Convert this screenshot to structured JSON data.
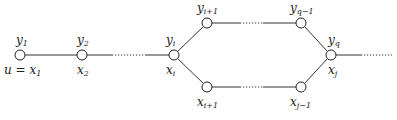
{
  "diagram": {
    "type": "path-graph-with-cycle",
    "nodes": [
      {
        "id": "x1",
        "x": 20,
        "y": 55,
        "top_label": "y",
        "top_sub": "1",
        "bottom_label": "u = x",
        "bottom_sub": "1"
      },
      {
        "id": "x2",
        "x": 82,
        "y": 55,
        "top_label": "y",
        "top_sub": "2",
        "bottom_label": "x",
        "bottom_sub": "2"
      },
      {
        "id": "xi",
        "x": 174,
        "y": 55,
        "top_label": "y",
        "top_sub": "i",
        "bottom_label": "x",
        "bottom_sub": "i"
      },
      {
        "id": "top_left",
        "x": 207,
        "y": 23,
        "top_label": "y",
        "top_sub": "i+1"
      },
      {
        "id": "top_right",
        "x": 301,
        "y": 23,
        "top_label": "y",
        "top_sub": "q−1"
      },
      {
        "id": "bottom_left",
        "x": 207,
        "y": 87,
        "bottom_label": "x",
        "bottom_sub": "i+1"
      },
      {
        "id": "bottom_right",
        "x": 301,
        "y": 87,
        "bottom_label": "x",
        "bottom_sub": "j−1"
      },
      {
        "id": "xj",
        "x": 331,
        "y": 55,
        "top_label": "y",
        "top_sub": "q",
        "bottom_label": "x",
        "bottom_sub": "j"
      }
    ],
    "edges": [
      {
        "from": "x1",
        "to": "x2",
        "style": "solid"
      },
      {
        "from": "x2",
        "to": "xi",
        "style": "solid-dotted-solid"
      },
      {
        "from": "xi",
        "to": "top_left",
        "style": "solid"
      },
      {
        "from": "xi",
        "to": "bottom_left",
        "style": "solid"
      },
      {
        "from": "top_left",
        "to": "top_right",
        "style": "solid-dotted-solid"
      },
      {
        "from": "bottom_left",
        "to": "bottom_right",
        "style": "solid-dotted-solid"
      },
      {
        "from": "top_right",
        "to": "xj",
        "style": "solid"
      },
      {
        "from": "bottom_right",
        "to": "xj",
        "style": "solid"
      },
      {
        "from": "xj",
        "to": "continuation",
        "style": "solid-then-dotted"
      }
    ]
  },
  "labels": {
    "y1": {
      "base": "y",
      "sub": "1"
    },
    "y2": {
      "base": "y",
      "sub": "2"
    },
    "yi": {
      "base": "y",
      "sub": "i"
    },
    "yi1": {
      "base": "y",
      "sub": "i+1"
    },
    "yq1": {
      "base": "y",
      "sub": "q−1"
    },
    "yq": {
      "base": "y",
      "sub": "q"
    },
    "x1": {
      "base": "u = x",
      "sub": "1"
    },
    "x2": {
      "base": "x",
      "sub": "2"
    },
    "xi": {
      "base": "x",
      "sub": "i"
    },
    "xi1": {
      "base": "x",
      "sub": "i+1"
    },
    "xj1": {
      "base": "x",
      "sub": "j−1"
    },
    "xj": {
      "base": "x",
      "sub": "j"
    }
  }
}
